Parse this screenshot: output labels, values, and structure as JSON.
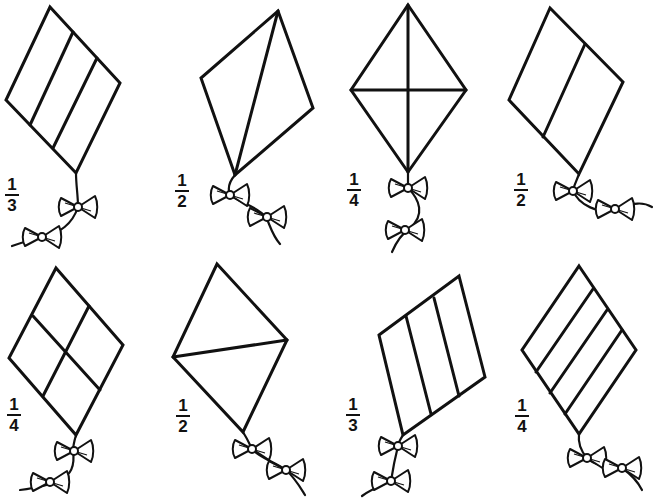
{
  "worksheet": {
    "title": "",
    "kites": [
      {
        "id": 1,
        "fraction": {
          "numerator": "1",
          "denominator": "3"
        },
        "label_pos": [
          5,
          177
        ],
        "outline": [
          [
            50,
            7
          ],
          [
            120,
            83
          ],
          [
            76,
            173
          ],
          [
            6,
            100
          ]
        ],
        "lines": [
          [
            [
              73,
              32
            ],
            [
              30,
              125
            ]
          ],
          [
            [
              97,
              58
            ],
            [
              53,
              148
            ]
          ]
        ],
        "tail": {
          "path": "M76,173 C76,185 78,195 78,207 C72,225 60,232 43,238 C30,240 20,243 12,246",
          "bows": [
            [
              78,
              207
            ],
            [
              42,
              237
            ]
          ]
        }
      },
      {
        "id": 2,
        "fraction": {
          "numerator": "1",
          "denominator": "2"
        },
        "label_pos": [
          175,
          173
        ],
        "outline": [
          [
            278,
            11
          ],
          [
            313,
            108
          ],
          [
            235,
            175
          ],
          [
            201,
            78
          ]
        ],
        "lines": [
          [
            [
              278,
              11
            ],
            [
              235,
              175
            ]
          ]
        ],
        "tail": {
          "path": "M235,175 C228,183 228,190 230,195 C240,203 255,205 266,217 C270,225 272,235 280,244",
          "bows": [
            [
              230,
              195
            ],
            [
              267,
              217
            ]
          ]
        }
      },
      {
        "id": 3,
        "fraction": {
          "numerator": "1",
          "denominator": "4"
        },
        "label_pos": [
          347,
          172
        ],
        "outline": [
          [
            408,
            5
          ],
          [
            466,
            90
          ],
          [
            408,
            172
          ],
          [
            351,
            90
          ]
        ],
        "lines": [
          [
            [
              408,
              5
            ],
            [
              408,
              172
            ]
          ],
          [
            [
              351,
              90
            ],
            [
              466,
              90
            ]
          ]
        ],
        "tail": {
          "path": "M408,172 C408,180 408,185 408,188 C420,200 425,215 410,228 C400,235 395,245 392,252",
          "bows": [
            [
              408,
              188
            ],
            [
              405,
              230
            ]
          ]
        }
      },
      {
        "id": 4,
        "fraction": {
          "numerator": "1",
          "denominator": "2"
        },
        "label_pos": [
          514,
          172
        ],
        "outline": [
          [
            550,
            8
          ],
          [
            623,
            82
          ],
          [
            579,
            174
          ],
          [
            509,
            100
          ]
        ],
        "lines": [
          [
            [
              585,
              44
            ],
            [
              543,
              137
            ]
          ]
        ],
        "tail": {
          "path": "M579,174 C576,182 574,186 573,190 C578,205 600,215 615,209 C630,205 640,200 652,207",
          "bows": [
            [
              573,
              191
            ],
            [
              615,
              209
            ]
          ]
        }
      },
      {
        "id": 5,
        "fraction": {
          "numerator": "1",
          "denominator": "4"
        },
        "label_pos": [
          7,
          397
        ],
        "outline": [
          [
            56,
            268
          ],
          [
            123,
            345
          ],
          [
            76,
            435
          ],
          [
            9,
            358
          ]
        ],
        "lines": [
          [
            [
              33,
              316
            ],
            [
              100,
              390
            ]
          ],
          [
            [
              89,
              306
            ],
            [
              43,
              396
            ]
          ]
        ],
        "tail": {
          "path": "M76,435 C74,442 73,447 73,451 C75,465 72,475 60,480 C50,485 35,488 20,490",
          "bows": [
            [
              74,
              451
            ],
            [
              50,
              482
            ]
          ]
        }
      },
      {
        "id": 6,
        "fraction": {
          "numerator": "1",
          "denominator": "2"
        },
        "label_pos": [
          176,
          398
        ],
        "outline": [
          [
            217,
            264
          ],
          [
            287,
            340
          ],
          [
            243,
            432
          ],
          [
            173,
            357
          ]
        ],
        "lines": [
          [
            [
              173,
              357
            ],
            [
              287,
              340
            ]
          ]
        ],
        "tail": {
          "path": "M243,432 C248,440 250,445 252,449 C260,458 275,462 286,470 C295,478 300,487 305,495",
          "bows": [
            [
              252,
              449
            ],
            [
              286,
              470
            ]
          ]
        }
      },
      {
        "id": 7,
        "fraction": {
          "numerator": "1",
          "denominator": "3"
        },
        "label_pos": [
          346,
          397
        ],
        "outline": [
          [
            379,
            335
          ],
          [
            459,
            276
          ],
          [
            485,
            377
          ],
          [
            403,
            435
          ]
        ],
        "lines": [
          [
            [
              406,
              316
            ],
            [
              431,
              414
            ]
          ],
          [
            [
              434,
              298
            ],
            [
              459,
              396
            ]
          ]
        ],
        "tail": {
          "path": "M403,435 C400,440 398,443 398,446 C395,458 393,468 391,481 C380,486 370,490 362,496",
          "bows": [
            [
              398,
              446
            ],
            [
              391,
              481
            ]
          ]
        }
      },
      {
        "id": 8,
        "fraction": {
          "numerator": "1",
          "denominator": "4"
        },
        "label_pos": [
          515,
          398
        ],
        "outline": [
          [
            579,
            266
          ],
          [
            636,
            350
          ],
          [
            579,
            434
          ],
          [
            522,
            350
          ]
        ],
        "lines": [
          [
            [
              593,
              289
            ],
            [
              536,
              372
            ]
          ],
          [
            [
              607,
              310
            ],
            [
              550,
              393
            ]
          ],
          [
            [
              622,
              330
            ],
            [
              565,
              414
            ]
          ]
        ],
        "tail": {
          "path": "M579,434 C578,442 580,450 587,458 C595,466 610,468 622,468 C632,475 638,482 642,490",
          "bows": [
            [
              587,
              458
            ],
            [
              622,
              468
            ]
          ]
        }
      }
    ]
  },
  "colors": {
    "ink": "#111111",
    "background": "#ffffff"
  }
}
